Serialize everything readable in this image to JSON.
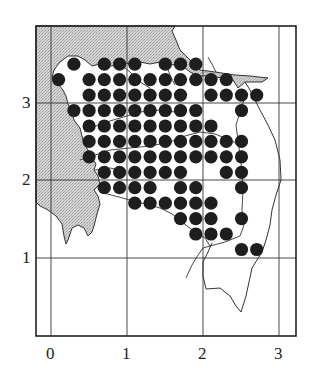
{
  "map": {
    "type": "distribution-dot-map",
    "x_ticks": [
      "0",
      "1",
      "2",
      "3"
    ],
    "y_ticks": [
      "1",
      "2",
      "3"
    ],
    "colors": {
      "dot": "#1e1e1e",
      "sea": "#c8c8c8",
      "line": "#333333",
      "frame": "#222222"
    },
    "dot_rows": [
      {
        "y": 3.5,
        "x": [
          0.3,
          0.7,
          0.9,
          1.1,
          1.5,
          1.7,
          1.9
        ]
      },
      {
        "y": 3.3,
        "x": [
          0.1,
          0.5,
          0.7,
          0.9,
          1.1,
          1.3,
          1.5,
          1.7,
          1.9,
          2.1,
          2.3
        ]
      },
      {
        "y": 3.1,
        "x": [
          0.5,
          0.7,
          0.9,
          1.1,
          1.3,
          1.5,
          1.7,
          2.1,
          2.3,
          2.5,
          2.7
        ]
      },
      {
        "y": 2.9,
        "x": [
          0.3,
          0.5,
          0.7,
          0.9,
          1.1,
          1.3,
          1.5,
          1.7,
          1.9,
          2.5
        ]
      },
      {
        "y": 2.7,
        "x": [
          0.5,
          0.7,
          0.9,
          1.1,
          1.3,
          1.5,
          1.7,
          1.9,
          2.1
        ]
      },
      {
        "y": 2.5,
        "x": [
          0.5,
          0.7,
          0.9,
          1.1,
          1.3,
          1.5,
          1.7,
          1.9,
          2.1,
          2.3,
          2.5
        ]
      },
      {
        "y": 2.3,
        "x": [
          0.5,
          0.7,
          0.9,
          1.1,
          1.3,
          1.5,
          1.7,
          1.9,
          2.1,
          2.3,
          2.5
        ]
      },
      {
        "y": 2.1,
        "x": [
          0.7,
          0.9,
          1.1,
          1.3,
          1.5,
          1.7,
          2.3,
          2.5
        ]
      },
      {
        "y": 1.9,
        "x": [
          0.7,
          0.9,
          1.1,
          1.3,
          1.7,
          1.9,
          2.5
        ]
      },
      {
        "y": 1.7,
        "x": [
          1.1,
          1.3,
          1.5,
          1.7,
          1.9,
          2.1
        ]
      },
      {
        "y": 1.5,
        "x": [
          1.7,
          1.9,
          2.1,
          2.5
        ]
      },
      {
        "y": 1.3,
        "x": [
          1.9,
          2.1,
          2.3
        ]
      },
      {
        "y": 1.1,
        "x": [
          2.5,
          2.7
        ]
      }
    ]
  }
}
